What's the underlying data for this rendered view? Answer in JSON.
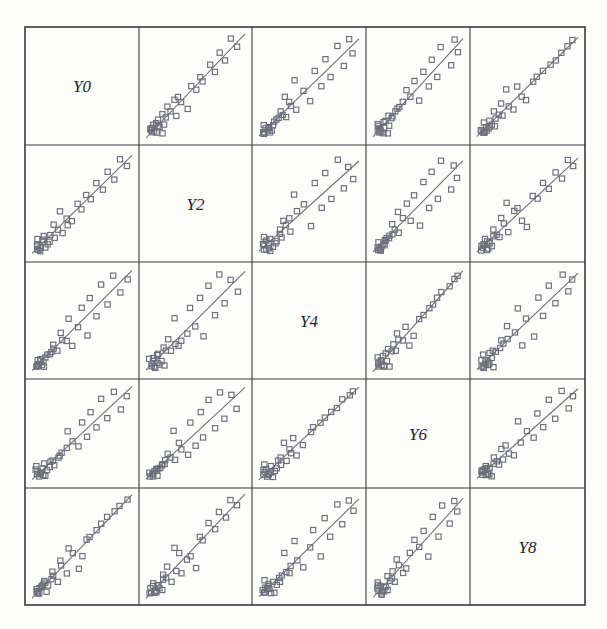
{
  "figure": {
    "kind": "scatterplot-matrix",
    "background_color": "#fdfdfc",
    "frame_color": "#3a3a3f",
    "marker_color": "#6e6e78",
    "marker_shape": "open-square",
    "line_color": "#6b6b74",
    "label_color": "#26262b"
  },
  "grid": {
    "rows": 5,
    "cols": 5,
    "x_edges": [
      25,
      139,
      252,
      366,
      470,
      585
    ],
    "y_edges": [
      27,
      145,
      262,
      379,
      488,
      605
    ]
  },
  "variables": [
    {
      "index": 0,
      "label": "Y0"
    },
    {
      "index": 1,
      "label": "Y2"
    },
    {
      "index": 2,
      "label": "Y4"
    },
    {
      "index": 3,
      "label": "Y6"
    },
    {
      "index": 4,
      "label": "Y8"
    }
  ],
  "chart_data": {
    "type": "scatter",
    "title": "",
    "subtitle": "",
    "xlabel": "",
    "ylabel": "",
    "grid": false,
    "legend": "none",
    "layout": "scatterplot-matrix 5x5, diagonal shows variable name, off-diagonal shows pairwise scatter with fitted least-squares line",
    "marker": "open square",
    "variables": [
      "Y0",
      "Y2",
      "Y4",
      "Y6",
      "Y8"
    ],
    "axis_ranges": {
      "Y0": [
        0,
        1
      ],
      "Y2": [
        0,
        1
      ],
      "Y4": [
        0,
        1
      ],
      "Y6": [
        0,
        1
      ],
      "Y8": [
        0,
        1
      ]
    },
    "note": "Values are normalized 0-1 within each panel; all pairs are strongly positively correlated with a dense cluster near the low end.",
    "observations": [
      {
        "Y0": 0.055,
        "Y2": 0.06,
        "Y4": 0.05,
        "Y6": 0.07,
        "Y8": 0.06
      },
      {
        "Y0": 0.07,
        "Y2": 0.05,
        "Y4": 0.08,
        "Y6": 0.055,
        "Y8": 0.09
      },
      {
        "Y0": 0.06,
        "Y2": 0.09,
        "Y4": 0.06,
        "Y6": 0.1,
        "Y8": 0.05
      },
      {
        "Y0": 0.09,
        "Y2": 0.07,
        "Y4": 0.1,
        "Y6": 0.08,
        "Y8": 0.11
      },
      {
        "Y0": 0.045,
        "Y2": 0.1,
        "Y4": 0.045,
        "Y6": 0.12,
        "Y8": 0.07
      },
      {
        "Y0": 0.11,
        "Y2": 0.12,
        "Y4": 0.09,
        "Y6": 0.06,
        "Y8": 0.13
      },
      {
        "Y0": 0.08,
        "Y2": 0.04,
        "Y4": 0.12,
        "Y6": 0.09,
        "Y8": 0.04
      },
      {
        "Y0": 0.1,
        "Y2": 0.14,
        "Y4": 0.07,
        "Y6": 0.13,
        "Y8": 0.1
      },
      {
        "Y0": 0.13,
        "Y2": 0.08,
        "Y4": 0.14,
        "Y6": 0.045,
        "Y8": 0.15
      },
      {
        "Y0": 0.05,
        "Y2": 0.16,
        "Y4": 0.11,
        "Y6": 0.16,
        "Y8": 0.08
      },
      {
        "Y0": 0.15,
        "Y2": 0.11,
        "Y4": 0.16,
        "Y6": 0.11,
        "Y8": 0.06
      },
      {
        "Y0": 0.12,
        "Y2": 0.18,
        "Y4": 0.055,
        "Y6": 0.18,
        "Y8": 0.17
      },
      {
        "Y0": 0.17,
        "Y2": 0.13,
        "Y4": 0.18,
        "Y6": 0.14,
        "Y8": 0.12
      },
      {
        "Y0": 0.19,
        "Y2": 0.2,
        "Y4": 0.2,
        "Y6": 0.21,
        "Y8": 0.19
      },
      {
        "Y0": 0.22,
        "Y2": 0.17,
        "Y4": 0.23,
        "Y6": 0.17,
        "Y8": 0.22
      },
      {
        "Y0": 0.26,
        "Y2": 0.25,
        "Y4": 0.21,
        "Y6": 0.25,
        "Y8": 0.16
      },
      {
        "Y0": 0.21,
        "Y2": 0.3,
        "Y4": 0.27,
        "Y6": 0.22,
        "Y8": 0.26
      },
      {
        "Y0": 0.3,
        "Y2": 0.22,
        "Y4": 0.32,
        "Y6": 0.29,
        "Y8": 0.31
      },
      {
        "Y0": 0.34,
        "Y2": 0.36,
        "Y4": 0.3,
        "Y6": 0.34,
        "Y8": 0.24
      },
      {
        "Y0": 0.28,
        "Y2": 0.42,
        "Y4": 0.38,
        "Y6": 0.27,
        "Y8": 0.37
      },
      {
        "Y0": 0.4,
        "Y2": 0.33,
        "Y4": 0.25,
        "Y6": 0.41,
        "Y8": 0.44
      },
      {
        "Y0": 0.46,
        "Y2": 0.5,
        "Y4": 0.44,
        "Y6": 0.37,
        "Y8": 0.29
      },
      {
        "Y0": 0.36,
        "Y2": 0.28,
        "Y4": 0.52,
        "Y6": 0.52,
        "Y8": 0.49
      },
      {
        "Y0": 0.55,
        "Y2": 0.58,
        "Y4": 0.35,
        "Y6": 0.46,
        "Y8": 0.56
      },
      {
        "Y0": 0.5,
        "Y2": 0.45,
        "Y4": 0.62,
        "Y6": 0.62,
        "Y8": 0.4
      },
      {
        "Y0": 0.64,
        "Y2": 0.7,
        "Y4": 0.55,
        "Y6": 0.56,
        "Y8": 0.66
      },
      {
        "Y0": 0.58,
        "Y2": 0.55,
        "Y4": 0.72,
        "Y6": 0.72,
        "Y8": 0.6
      },
      {
        "Y0": 0.75,
        "Y2": 0.8,
        "Y4": 0.66,
        "Y6": 0.66,
        "Y8": 0.78
      },
      {
        "Y0": 0.7,
        "Y2": 0.64,
        "Y4": 0.84,
        "Y6": 0.86,
        "Y8": 0.72
      },
      {
        "Y0": 0.88,
        "Y2": 0.92,
        "Y4": 0.78,
        "Y6": 0.76,
        "Y8": 0.9
      },
      {
        "Y0": 0.82,
        "Y2": 0.74,
        "Y4": 0.94,
        "Y6": 0.94,
        "Y8": 0.84
      },
      {
        "Y0": 0.95,
        "Y2": 0.86,
        "Y4": 0.9,
        "Y6": 0.9,
        "Y8": 0.95
      }
    ],
    "panels": [
      {
        "row": 0,
        "col": 0,
        "kind": "diagonal",
        "label": "Y0"
      },
      {
        "row": 0,
        "col": 1,
        "kind": "scatter",
        "x": "Y2",
        "y": "Y0",
        "fit_line": true
      },
      {
        "row": 0,
        "col": 2,
        "kind": "scatter",
        "x": "Y4",
        "y": "Y0",
        "fit_line": true
      },
      {
        "row": 0,
        "col": 3,
        "kind": "scatter",
        "x": "Y6",
        "y": "Y0",
        "fit_line": true
      },
      {
        "row": 0,
        "col": 4,
        "kind": "scatter",
        "x": "Y8",
        "y": "Y0",
        "fit_line": true
      },
      {
        "row": 1,
        "col": 0,
        "kind": "scatter",
        "x": "Y0",
        "y": "Y2",
        "fit_line": true
      },
      {
        "row": 1,
        "col": 1,
        "kind": "diagonal",
        "label": "Y2"
      },
      {
        "row": 1,
        "col": 2,
        "kind": "scatter",
        "x": "Y4",
        "y": "Y2",
        "fit_line": true
      },
      {
        "row": 1,
        "col": 3,
        "kind": "scatter",
        "x": "Y6",
        "y": "Y2",
        "fit_line": true
      },
      {
        "row": 1,
        "col": 4,
        "kind": "scatter",
        "x": "Y8",
        "y": "Y2",
        "fit_line": true
      },
      {
        "row": 2,
        "col": 0,
        "kind": "scatter",
        "x": "Y0",
        "y": "Y4",
        "fit_line": true
      },
      {
        "row": 2,
        "col": 1,
        "kind": "scatter",
        "x": "Y2",
        "y": "Y4",
        "fit_line": true
      },
      {
        "row": 2,
        "col": 2,
        "kind": "diagonal",
        "label": "Y4"
      },
      {
        "row": 2,
        "col": 3,
        "kind": "scatter",
        "x": "Y6",
        "y": "Y4",
        "fit_line": true
      },
      {
        "row": 2,
        "col": 4,
        "kind": "scatter",
        "x": "Y8",
        "y": "Y4",
        "fit_line": true
      },
      {
        "row": 3,
        "col": 0,
        "kind": "scatter",
        "x": "Y0",
        "y": "Y6",
        "fit_line": true
      },
      {
        "row": 3,
        "col": 1,
        "kind": "scatter",
        "x": "Y2",
        "y": "Y6",
        "fit_line": true
      },
      {
        "row": 3,
        "col": 2,
        "kind": "scatter",
        "x": "Y4",
        "y": "Y6",
        "fit_line": true
      },
      {
        "row": 3,
        "col": 3,
        "kind": "diagonal",
        "label": "Y6"
      },
      {
        "row": 3,
        "col": 4,
        "kind": "scatter",
        "x": "Y8",
        "y": "Y6",
        "fit_line": true
      },
      {
        "row": 4,
        "col": 0,
        "kind": "scatter",
        "x": "Y0",
        "y": "Y8",
        "fit_line": true
      },
      {
        "row": 4,
        "col": 1,
        "kind": "scatter",
        "x": "Y2",
        "y": "Y8",
        "fit_line": true
      },
      {
        "row": 4,
        "col": 2,
        "kind": "scatter",
        "x": "Y4",
        "y": "Y8",
        "fit_line": true
      },
      {
        "row": 4,
        "col": 3,
        "kind": "scatter",
        "x": "Y6",
        "y": "Y8",
        "fit_line": true
      },
      {
        "row": 4,
        "col": 4,
        "kind": "diagonal",
        "label": "Y8"
      }
    ]
  }
}
